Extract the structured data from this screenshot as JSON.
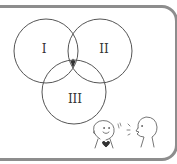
{
  "diagram": {
    "type": "venn",
    "sets": [
      {
        "label": "I",
        "cx": 46,
        "cy": 51,
        "r": 32
      },
      {
        "label": "II",
        "cx": 100,
        "cy": 51,
        "r": 32
      },
      {
        "label": "III",
        "cx": 74,
        "cy": 92,
        "r": 32
      }
    ],
    "highlighted_region": "I ∩ II ∩ III",
    "colors": {
      "border": "#8d8d8d",
      "circle_stroke": "#555555",
      "highlight_fill": "#333333",
      "text": "#333333"
    }
  },
  "labels": {
    "set1": "I",
    "set2": "II",
    "set3": "III"
  },
  "illustration": {
    "description": "two stick figures talking; left figure smiling with heart on chest, right figure speaking",
    "left_mark": "♪",
    "heart_icon": "heart"
  }
}
